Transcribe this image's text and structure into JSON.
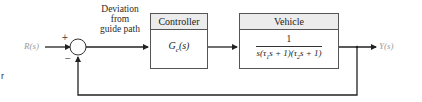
{
  "diagram": {
    "type": "feedback-control-block-diagram",
    "input_label": "R(s)",
    "output_label": "Y(s)",
    "summing_junction": {
      "plus_sign": "+",
      "minus_sign": "−"
    },
    "error_label_lines": [
      "Deviation",
      "from",
      "guide path"
    ],
    "blocks": [
      {
        "header": "Controller",
        "transfer_function": "Gc(s)",
        "tf_main": "G",
        "tf_sub": "c",
        "tf_arg": "(s)"
      },
      {
        "header": "Vehicle",
        "transfer_function": "1 / s(τ1s + 1)(τ2s + 1)",
        "numerator": "1",
        "den_parts": [
          "s(τ",
          "1",
          "s + 1)(τ",
          "2",
          "s + 1)"
        ]
      }
    ],
    "feedback": "unity negative feedback from Y(s) to summing junction",
    "edge_mark": "r",
    "colors": {
      "line": "#222222",
      "block_border": "#555555",
      "header_bg": "#ececec",
      "io_label": "#9a9a9a"
    }
  }
}
